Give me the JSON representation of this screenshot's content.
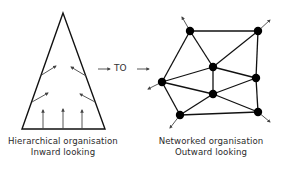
{
  "hierarchical": {
    "title": "Hierarchical organisation",
    "subtitle": "Inward looking"
  },
  "transition": {
    "label": "TO"
  },
  "networked": {
    "title": "Networked organisation",
    "subtitle": "Outward looking"
  },
  "colors": {
    "line": "#111111",
    "arrow": "#444444",
    "text": "#2a2a2a"
  }
}
